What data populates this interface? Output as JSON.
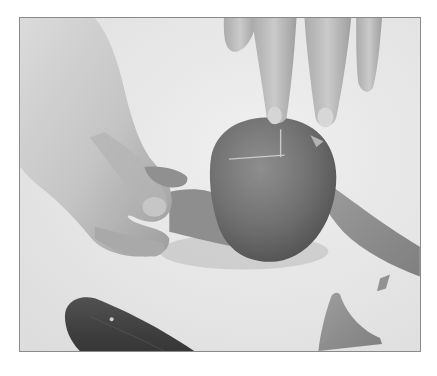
{
  "photo": {
    "description": "Grayscale photograph of hands peeling the skin from a blanched tomato with a cross scored on top; a paring knife lies in the lower left and strips of peel lie on the work surface at lower right.",
    "colors": {
      "background": "#e9e9e9",
      "border": "#8a8a8a",
      "skin_light": "#d2d2d2",
      "skin_mid": "#b5b5b5",
      "skin_shadow": "#8e8e8e",
      "tomato": "#6f6f6f",
      "tomato_dark": "#555555",
      "peel": "#8c8c8c",
      "knife_handle": "#3d3d3d"
    },
    "subjects": [
      {
        "name": "left-hand",
        "label": "Hand pinching tomato peel"
      },
      {
        "name": "right-hand-fingers",
        "label": "Fingers holding tomato"
      },
      {
        "name": "tomato",
        "label": "Blanched tomato with scored cross"
      },
      {
        "name": "peel-strip",
        "label": "Peeled tomato skin"
      },
      {
        "name": "knife",
        "label": "Paring knife with dark handle"
      },
      {
        "name": "peel-scrap",
        "label": "Scraps of peel on surface"
      }
    ]
  }
}
